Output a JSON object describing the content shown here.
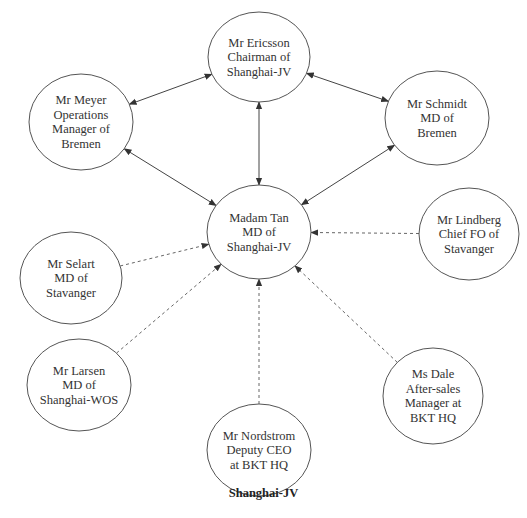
{
  "caption": "Shanghai-JV",
  "colors": {
    "line": "#444444",
    "dashed": "#666666",
    "text": "#333333",
    "background": "#ffffff"
  },
  "nodes": [
    {
      "id": "ericsson",
      "lines": [
        "Mr Ericsson",
        "Chairman of",
        "Shanghai-JV"
      ],
      "cx": 259,
      "cy": 57,
      "rx": 51,
      "ry": 45
    },
    {
      "id": "meyer",
      "lines": [
        "Mr Meyer",
        "Operations",
        "Manager of",
        "Bremen"
      ],
      "cx": 81,
      "cy": 122,
      "rx": 52,
      "ry": 48
    },
    {
      "id": "schmidt",
      "lines": [
        "Mr Schmidt",
        "MD of",
        "Bremen"
      ],
      "cx": 437,
      "cy": 118,
      "rx": 52,
      "ry": 47
    },
    {
      "id": "tan",
      "lines": [
        "Madam Tan",
        "MD of",
        "Shanghai-JV"
      ],
      "cx": 259,
      "cy": 232,
      "rx": 52,
      "ry": 47
    },
    {
      "id": "selart",
      "lines": [
        "Mr Selart",
        "MD of",
        "Stavanger"
      ],
      "cx": 71,
      "cy": 278,
      "rx": 51,
      "ry": 46
    },
    {
      "id": "lindberg",
      "lines": [
        "Mr Lindberg",
        "Chief FO of",
        "Stavanger"
      ],
      "cx": 469,
      "cy": 234,
      "rx": 50,
      "ry": 46
    },
    {
      "id": "larsen",
      "lines": [
        "Mr Larsen",
        "MD of",
        "Shanghai-WOS"
      ],
      "cx": 79,
      "cy": 385,
      "rx": 52,
      "ry": 46
    },
    {
      "id": "nordstrom",
      "lines": [
        "Mr Nordstrom",
        "Deputy CEO",
        "at BKT HQ"
      ],
      "cx": 259,
      "cy": 450,
      "rx": 52,
      "ry": 46
    },
    {
      "id": "dale",
      "lines": [
        "Ms Dale",
        "After-sales",
        "Manager at",
        "BKT HQ"
      ],
      "cx": 433,
      "cy": 396,
      "rx": 50,
      "ry": 48
    }
  ],
  "edges": [
    {
      "from": "meyer",
      "to": "ericsson",
      "style": "solid",
      "arrows": "both"
    },
    {
      "from": "schmidt",
      "to": "ericsson",
      "style": "solid",
      "arrows": "both"
    },
    {
      "from": "ericsson",
      "to": "tan",
      "style": "solid",
      "arrows": "both"
    },
    {
      "from": "meyer",
      "to": "tan",
      "style": "solid",
      "arrows": "both"
    },
    {
      "from": "schmidt",
      "to": "tan",
      "style": "solid",
      "arrows": "both"
    },
    {
      "from": "selart",
      "to": "tan",
      "style": "dashed",
      "arrows": "end"
    },
    {
      "from": "lindberg",
      "to": "tan",
      "style": "dashed",
      "arrows": "end"
    },
    {
      "from": "larsen",
      "to": "tan",
      "style": "dashed",
      "arrows": "end"
    },
    {
      "from": "nordstrom",
      "to": "tan",
      "style": "dashed",
      "arrows": "end"
    },
    {
      "from": "dale",
      "to": "tan",
      "style": "dashed",
      "arrows": "end"
    }
  ]
}
